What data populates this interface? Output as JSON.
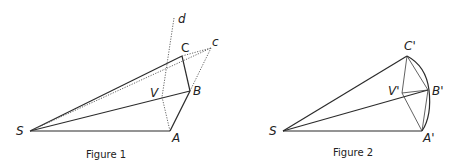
{
  "figure1": {
    "caption": "Figure 1",
    "labels": {
      "S": "S",
      "A": "A",
      "B": "B",
      "C": "C",
      "c": "c",
      "V": "V",
      "d": "d"
    }
  },
  "figure2": {
    "caption": "Figure 2",
    "labels": {
      "S": "S",
      "A": "A'",
      "B": "B'",
      "C": "C'",
      "V": "V'"
    }
  }
}
